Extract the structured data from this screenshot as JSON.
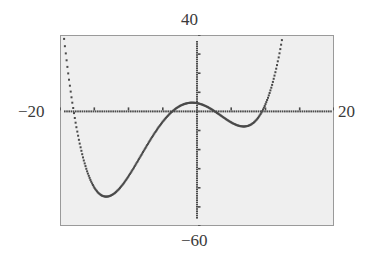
{
  "window": {
    "xmin_label": "−20",
    "xmax_label": "20",
    "ymin_label": "−60",
    "ymax_label": "40"
  },
  "colors": {
    "screen_bg": "#efefef",
    "frame": "#9a9a9a",
    "pixel": "#4a4a4a"
  },
  "chart_data": {
    "type": "line",
    "title": "",
    "xlabel": "",
    "ylabel": "",
    "xlim": [
      -20,
      20
    ],
    "ylim": [
      -60,
      40
    ],
    "xscale_tick": 5,
    "yscale_tick": 10,
    "grid": false,
    "legend": null,
    "style": "graphing-calculator dot plot",
    "function": "f(x) ≈ 0.0027·(x+18)(x+3.6)(x−2.6)(x−9.5)",
    "coefficient": 0.0027,
    "roots": [
      -18,
      -3.6,
      2.6,
      9.5
    ],
    "key_points": [
      {
        "x": -18,
        "y": 0,
        "kind": "zero"
      },
      {
        "x": -12.7,
        "y": -46,
        "kind": "local-min"
      },
      {
        "x": -3.6,
        "y": 0,
        "kind": "zero"
      },
      {
        "x": 0,
        "y": 4,
        "kind": "local-max"
      },
      {
        "x": 2.6,
        "y": 0,
        "kind": "zero"
      },
      {
        "x": 6.7,
        "y": -5.5,
        "kind": "local-min"
      },
      {
        "x": 9.5,
        "y": 0,
        "kind": "zero"
      }
    ],
    "x_ticks": [
      -20,
      -15,
      -10,
      -5,
      0,
      5,
      10,
      15,
      20
    ],
    "y_ticks": [
      -60,
      -50,
      -40,
      -30,
      -20,
      -10,
      0,
      10,
      20,
      30,
      40
    ]
  }
}
